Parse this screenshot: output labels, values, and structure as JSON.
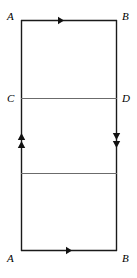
{
  "figure": {
    "kind": "identification-diagram",
    "stroke_color": "#1a1a1a",
    "interior_stroke_color": "#6b6b6b",
    "background_color": "#ffffff",
    "rect": {
      "left": 21,
      "top": 20,
      "right": 117,
      "bottom": 251
    },
    "labels": {
      "top_left": "A",
      "top_right": "B",
      "mid_left": "C",
      "mid_right": "D",
      "bottom_left": "A",
      "bottom_right": "B"
    },
    "edges": [
      {
        "name": "top-edge",
        "from": "A",
        "to": "B",
        "orientation": "horizontal",
        "direction": "right",
        "arrow_count": 1
      },
      {
        "name": "bottom-edge",
        "from": "A",
        "to": "B",
        "orientation": "horizontal",
        "direction": "right",
        "arrow_count": 1
      },
      {
        "name": "left-edge",
        "from": "A",
        "to": "A",
        "orientation": "vertical",
        "direction": "up",
        "arrow_count": 2
      },
      {
        "name": "right-edge",
        "from": "B",
        "to": "B",
        "orientation": "vertical",
        "direction": "down",
        "arrow_count": 2
      }
    ],
    "interior_segments": [
      {
        "name": "segment-CD",
        "y": 98,
        "left_label": "C",
        "right_label": "D"
      },
      {
        "name": "segment-unlabeled",
        "y": 173,
        "left_label": "",
        "right_label": ""
      }
    ]
  }
}
